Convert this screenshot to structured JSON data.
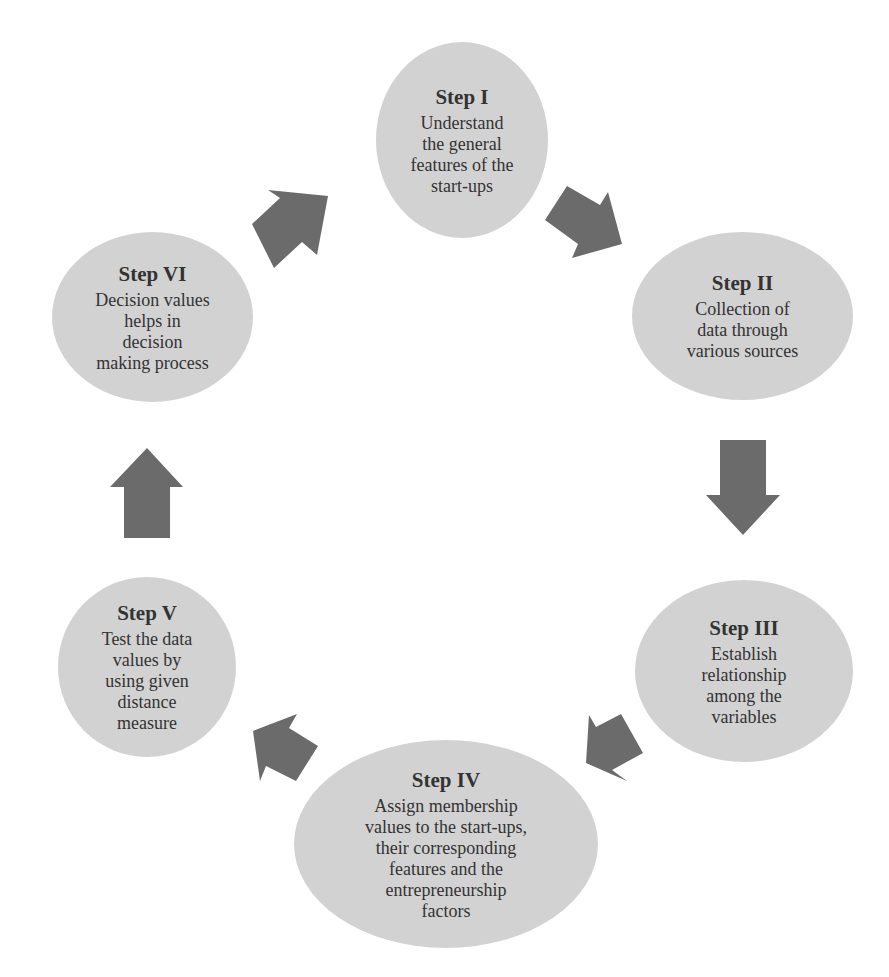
{
  "diagram": {
    "type": "cycle",
    "colors": {
      "node_fill": "#d2d2d2",
      "arrow_fill": "#6b6b6b",
      "text": "#333333",
      "background": "#ffffff"
    },
    "steps": [
      {
        "title": "Step I",
        "text": "Understand\nthe  general\nfeatures  of the\nstart-ups"
      },
      {
        "title": "Step II",
        "text": "Collection  of\ndata through\nvarious  sources"
      },
      {
        "title": "Step III",
        "text": "Establish\nrelationship\namong the\nvariables"
      },
      {
        "title": "Step IV",
        "text": "Assign membership\nvalues  to the start-ups,\ntheir  corresponding\nfeatures  and the\nentrepreneurship\nfactors"
      },
      {
        "title": "Step V",
        "text": "Test the  data\nvalues  by\nusing   given\ndistance\nmeasure"
      },
      {
        "title": "Step VI",
        "text": "Decision  values\nhelps in\ndecision\nmaking   process"
      }
    ],
    "arrows": [
      {
        "from": "Step I",
        "to": "Step II",
        "direction": "down-right"
      },
      {
        "from": "Step II",
        "to": "Step III",
        "direction": "down"
      },
      {
        "from": "Step III",
        "to": "Step IV",
        "direction": "down-left"
      },
      {
        "from": "Step IV",
        "to": "Step V",
        "direction": "up-left"
      },
      {
        "from": "Step V",
        "to": "Step VI",
        "direction": "up"
      },
      {
        "from": "Step VI",
        "to": "Step I",
        "direction": "up-right"
      }
    ]
  }
}
